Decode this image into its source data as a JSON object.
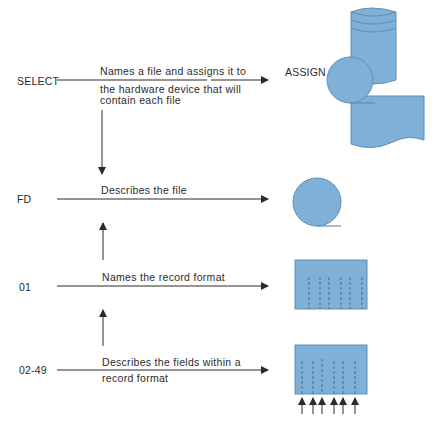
{
  "diagram": {
    "rows": [
      {
        "keyword": "SELECT",
        "description_lines": [
          "Names a file and assigns it to",
          "the hardware device that will",
          "contain each file"
        ],
        "target_label": "ASSIGN",
        "target_icon": "storage-devices-icon"
      },
      {
        "keyword": "FD",
        "description_lines": [
          "Describes the file"
        ],
        "target_icon": "file-circle-icon"
      },
      {
        "keyword": "01",
        "description_lines": [
          "Names the record format"
        ],
        "target_icon": "record-format-icon"
      },
      {
        "keyword": "02-49",
        "description_lines": [
          "Describes the fields within a",
          "record format"
        ],
        "target_icon": "record-fields-icon"
      }
    ],
    "colors": {
      "shape_fill": "#7fb1d8",
      "shape_stroke": "#5f8fb5",
      "line": "#2a2a2a",
      "dash": "#3d6f99"
    }
  }
}
